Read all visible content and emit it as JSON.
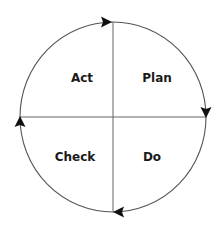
{
  "diagram": {
    "type": "cycle",
    "title": "",
    "center": {
      "x": 113,
      "y": 117
    },
    "radius_x": 93,
    "radius_y": 95,
    "line_color": "#555555",
    "arrow_color": "#111111",
    "text_color": "#1a1a1a",
    "direction": "clockwise",
    "quadrants": [
      {
        "position": "top-left",
        "label": "Act"
      },
      {
        "position": "top-right",
        "label": "Plan"
      },
      {
        "position": "bottom-left",
        "label": "Check"
      },
      {
        "position": "bottom-right",
        "label": "Do"
      }
    ],
    "arrows": [
      {
        "position": "top",
        "points": "right"
      },
      {
        "position": "right",
        "points": "down"
      },
      {
        "position": "bottom",
        "points": "left"
      },
      {
        "position": "left",
        "points": "up"
      }
    ]
  }
}
